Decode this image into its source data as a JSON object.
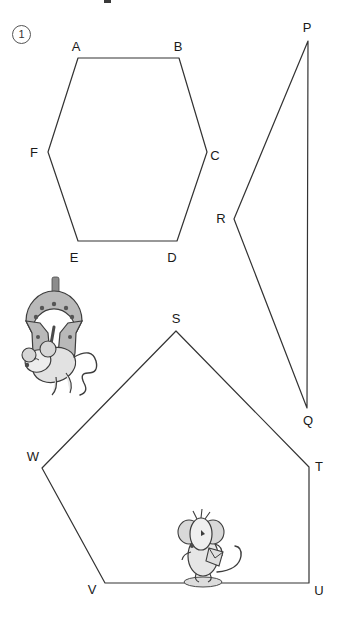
{
  "worksheet": {
    "question_number": "1",
    "top_mark": "",
    "background_color": "#ffffff",
    "stroke_color": "#333333",
    "label_color": "#1a1a1a"
  },
  "figures": [
    {
      "name": "hexagon-abcdef",
      "shape": "hexagon",
      "vertex_count": 6,
      "points": [
        {
          "label": "A",
          "x": 78,
          "y": 58,
          "label_x": 76,
          "label_y": 46
        },
        {
          "label": "B",
          "x": 179,
          "y": 58,
          "label_x": 178,
          "label_y": 46
        },
        {
          "label": "C",
          "x": 207,
          "y": 152,
          "label_x": 215,
          "label_y": 155
        },
        {
          "label": "D",
          "x": 177,
          "y": 241,
          "label_x": 172,
          "label_y": 257
        },
        {
          "label": "E",
          "x": 78,
          "y": 241,
          "label_x": 74,
          "label_y": 257
        },
        {
          "label": "F",
          "x": 48,
          "y": 152,
          "label_x": 34,
          "label_y": 152
        }
      ]
    },
    {
      "name": "triangle-pqr",
      "shape": "triangle",
      "vertex_count": 3,
      "points": [
        {
          "label": "P",
          "x": 308,
          "y": 41,
          "label_x": 307,
          "label_y": 27
        },
        {
          "label": "Q",
          "x": 307,
          "y": 408,
          "label_x": 308,
          "label_y": 420
        },
        {
          "label": "R",
          "x": 234,
          "y": 219,
          "label_x": 221,
          "label_y": 218
        }
      ]
    },
    {
      "name": "pentagon-stuvw",
      "shape": "pentagon",
      "vertex_count": 5,
      "points": [
        {
          "label": "S",
          "x": 176,
          "y": 331,
          "label_x": 176,
          "label_y": 318
        },
        {
          "label": "T",
          "x": 309,
          "y": 467,
          "label_x": 319,
          "label_y": 466
        },
        {
          "label": "U",
          "x": 309,
          "y": 583,
          "label_x": 319,
          "label_y": 590
        },
        {
          "label": "V",
          "x": 105,
          "y": 583,
          "label_x": 92,
          "label_y": 589
        },
        {
          "label": "W",
          "x": 42,
          "y": 468,
          "label_x": 33,
          "label_y": 456
        }
      ]
    }
  ],
  "illustrations": [
    {
      "name": "mouse-hanging-from-horseshoe",
      "description": "Cartoon mouse hanging from a horseshoe",
      "x": 12,
      "y": 277,
      "width": 96,
      "height": 118
    },
    {
      "name": "mouse-standing",
      "description": "Cartoon mouse standing and holding an object",
      "x": 165,
      "y": 508,
      "width": 88,
      "height": 78
    }
  ]
}
